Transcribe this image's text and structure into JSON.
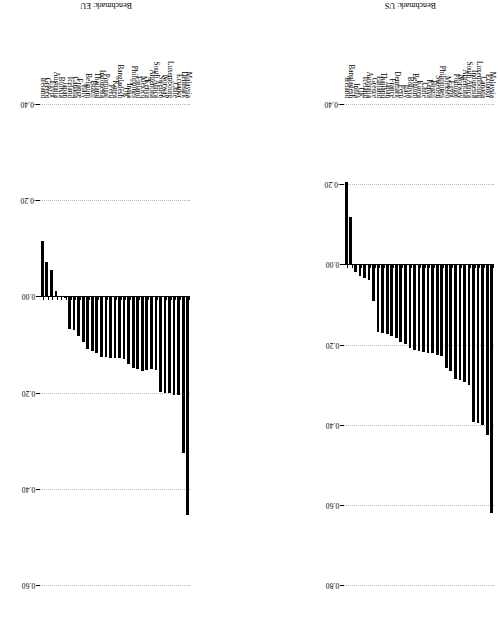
{
  "figure": {
    "orientation": "rotated-90",
    "bar_color": "#000000",
    "grid_color": "#b9b9b9",
    "background": "#ffffff"
  },
  "chart_data": [
    {
      "type": "bar",
      "title": "Benchmark: EU",
      "panel": "top",
      "xlabel": "",
      "ylabel": "",
      "ylim": [
        -0.4,
        0.6
      ],
      "ticks": [
        "-0.40",
        "-0.20",
        "0.00",
        "0.20",
        "0.40",
        "0.60"
      ],
      "tick_values": [
        -0.4,
        -0.2,
        0.0,
        0.2,
        0.4,
        0.6
      ],
      "grid": true,
      "legend": "none",
      "categories": [
        "Malaysia",
        "Denmark",
        "Ecuador",
        "Chile",
        "Luxembourg",
        "Norway",
        "Sweden",
        "South Africa",
        "Argentina",
        "Kenya",
        "Mexico",
        "Finland",
        "Philippines",
        "India",
        "UK",
        "Bangladesh",
        "Korea",
        "Peru",
        "Portugal",
        "Indonesia",
        "Thailand",
        "Brazil",
        "Belgium",
        "Italy",
        "France",
        "Canada",
        "Iceland",
        "Japan",
        "Bolivia",
        "Australia",
        "Egypt",
        "Greece",
        "Ireland"
      ],
      "values": [
        0.455,
        0.325,
        0.205,
        0.205,
        0.2,
        0.2,
        0.198,
        0.152,
        0.15,
        0.152,
        0.155,
        0.15,
        0.148,
        0.14,
        0.13,
        0.128,
        0.128,
        0.128,
        0.127,
        0.125,
        0.118,
        0.113,
        0.11,
        0.095,
        0.082,
        0.07,
        0.068,
        0.003,
        0.002,
        -0.012,
        -0.055,
        -0.072,
        -0.115
      ]
    },
    {
      "type": "bar",
      "title": "Benchmark: US",
      "panel": "bottom",
      "xlabel": "",
      "ylabel": "",
      "ylim": [
        -0.4,
        0.8
      ],
      "ticks": [
        "-0.40",
        "-0.20",
        "0.00",
        "0.20",
        "0.40",
        "0.60",
        "0.80"
      ],
      "tick_values": [
        -0.4,
        -0.2,
        0.0,
        0.2,
        0.4,
        0.6,
        0.8
      ],
      "grid": true,
      "legend": "none",
      "categories": [
        "Malaysia",
        "Ecuador",
        "Canada",
        "Luxembourg",
        "Indonesia",
        "South Africa",
        "Argentina",
        "Norway",
        "Portugal",
        "Egypt",
        "Mexico",
        "Philippines",
        "Sweden",
        "Brazil",
        "Kenya",
        "Chile",
        "Korea",
        "Belgium",
        "Bolivia",
        "Italy",
        "Peru",
        "Denmark",
        "France",
        "Japan",
        "Thailand",
        "Finland",
        "Greece",
        "Australia",
        "Iceland",
        "UK",
        "India",
        "Bangladesh",
        "Ireland"
      ],
      "values": [
        0.62,
        0.425,
        0.4,
        0.395,
        0.393,
        0.3,
        0.293,
        0.288,
        0.285,
        0.265,
        0.258,
        0.228,
        0.225,
        0.222,
        0.22,
        0.218,
        0.215,
        0.213,
        0.208,
        0.198,
        0.195,
        0.183,
        0.178,
        0.175,
        0.172,
        0.168,
        0.092,
        0.04,
        0.035,
        0.03,
        0.018,
        -0.118,
        -0.205
      ]
    }
  ]
}
